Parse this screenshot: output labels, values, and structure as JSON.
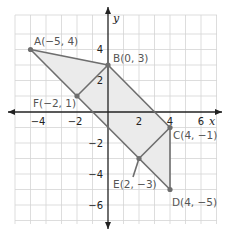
{
  "diagram": {
    "axes": {
      "x_label": "x",
      "y_label": "y",
      "x_ticks": [
        {
          "value": -4,
          "label": "−4"
        },
        {
          "value": -2,
          "label": "−2"
        },
        {
          "value": 2,
          "label": "2"
        },
        {
          "value": 4,
          "label": "4"
        },
        {
          "value": 6,
          "label": "6"
        }
      ],
      "y_ticks": [
        {
          "value": 4,
          "label": "4"
        },
        {
          "value": 2,
          "label": "2"
        },
        {
          "value": -2,
          "label": "−2"
        },
        {
          "value": -4,
          "label": "−4"
        },
        {
          "value": -6,
          "label": "−6"
        }
      ],
      "grid": true
    },
    "points": {
      "A": {
        "label": "A(−5, 4)",
        "x": -5,
        "y": 4
      },
      "B": {
        "label": "B(0, 3)",
        "x": 0,
        "y": 3
      },
      "C": {
        "label": "C(4, −1)",
        "x": 4,
        "y": -1
      },
      "D": {
        "label": "D(4, −5)",
        "x": 4,
        "y": -5
      },
      "E": {
        "label": "E(2, −3)",
        "x": 2,
        "y": -3
      },
      "F": {
        "label": "F(−2, 1)",
        "x": -2,
        "y": 1
      }
    },
    "polygon_order": [
      "A",
      "B",
      "C",
      "D",
      "E",
      "F"
    ],
    "colors": {
      "fill": "#ebebeb",
      "edge": "#6e6e6e",
      "grid": "#d4d4d4",
      "axis": "#222222",
      "point": "#6e6e6e"
    }
  }
}
